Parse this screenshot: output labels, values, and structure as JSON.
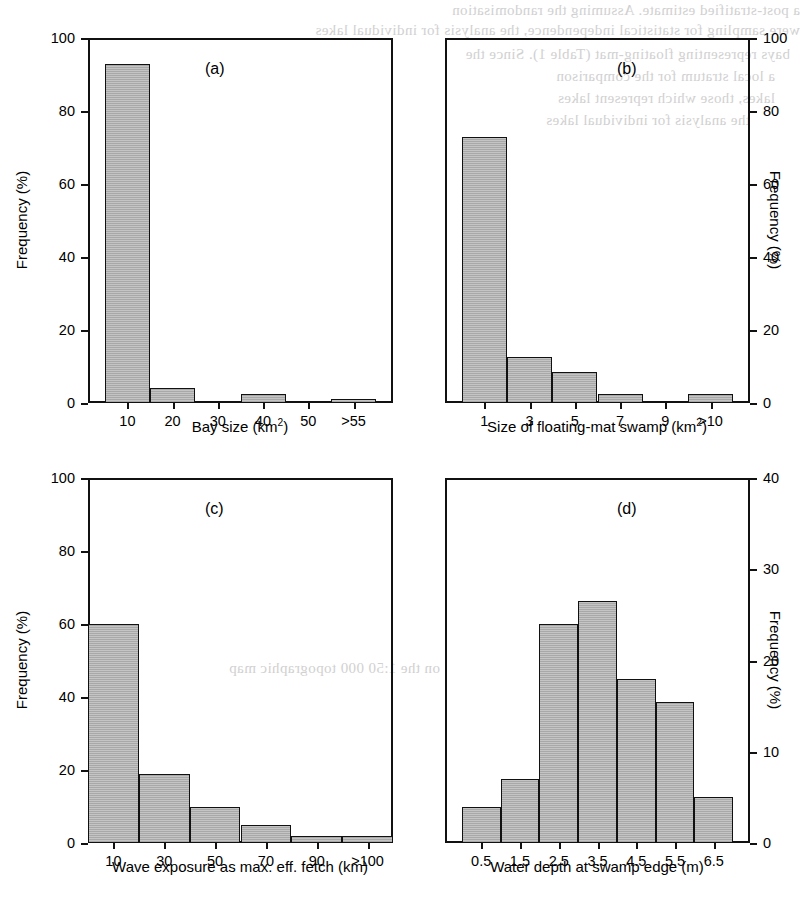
{
  "figure": {
    "panels": [
      "a",
      "b",
      "c",
      "d"
    ],
    "fill_color": "#b4b4b4",
    "line_color": "#111111"
  },
  "ghost_text": [
    "a post-stratified estimate. Assuming the randomisation",
    "were sampling for statistical independence, the analysis for individual lakes",
    "bays representing floating-mat (Table 1). Since the",
    "a local stratum for the comparison",
    "lakes, those which represent lakes",
    "the analysis for individual lakes",
    "on the 1:50 000 topographic map"
  ],
  "chart_data": [
    {
      "type": "bar",
      "panel": "a",
      "title": "(a)",
      "categories": [
        "10",
        "20",
        "30",
        "40",
        "50",
        ">55"
      ],
      "values": [
        93,
        4,
        0,
        2.5,
        0,
        1
      ],
      "xlabel": "Bay size (km2)",
      "xlabel_base": "Bay size (km",
      "xlabel_sup": "2",
      "xlabel_tail": ")",
      "ylabel": "Frequency (%)",
      "ylim": [
        0,
        100
      ],
      "yticks": [
        0,
        20,
        40,
        60,
        80,
        100
      ],
      "y_axis_side": "left",
      "grid": false
    },
    {
      "type": "bar",
      "panel": "b",
      "title": "(b)",
      "categories": [
        "1",
        "3",
        "5",
        "7",
        "9",
        ">10"
      ],
      "values": [
        73,
        12.5,
        8.5,
        2.5,
        0,
        2.5
      ],
      "xlabel": "Size of floating-mat swamp (km2)",
      "xlabel_base": "Size of floating-mat swamp (km",
      "xlabel_sup": "2",
      "xlabel_tail": ")",
      "ylabel": "Frequency (%)",
      "ylim": [
        0,
        100
      ],
      "yticks": [
        0,
        20,
        40,
        60,
        80,
        100
      ],
      "y_axis_side": "right",
      "grid": false
    },
    {
      "type": "bar",
      "panel": "c",
      "title": "(c)",
      "categories": [
        "10",
        "30",
        "50",
        "70",
        "90",
        ">100"
      ],
      "values": [
        60,
        19,
        10,
        5,
        2,
        2
      ],
      "xlabel": "Wave exposure as max. eff. fetch (km)",
      "ylabel": "Frequency (%)",
      "ylim": [
        0,
        100
      ],
      "yticks": [
        0,
        20,
        40,
        60,
        80,
        100
      ],
      "y_axis_side": "left",
      "grid": false
    },
    {
      "type": "bar",
      "panel": "d",
      "title": "(d)",
      "categories": [
        "0.5",
        "1.5",
        "2.5",
        "3.5",
        "4.5",
        "5.5",
        "6.5"
      ],
      "values": [
        4,
        7,
        24,
        26.5,
        18,
        15.5,
        5
      ],
      "xlabel": "Water depth at swamp edge (m)",
      "ylabel": "Frequency (%)",
      "ylim": [
        0,
        40
      ],
      "yticks": [
        0,
        10,
        20,
        30,
        40
      ],
      "y_axis_side": "right",
      "grid": false
    }
  ]
}
